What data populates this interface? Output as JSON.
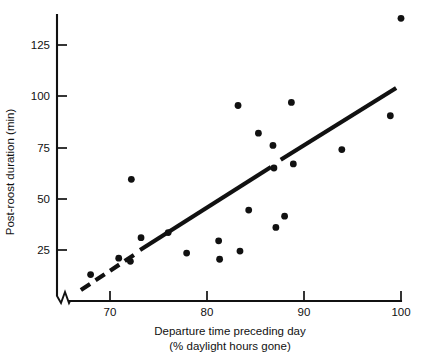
{
  "chart_data": {
    "type": "scatter",
    "title": "",
    "xlabel": "Departure time preceding day",
    "xlabel_line2": "(% daylight hours gone)",
    "ylabel": "Post-roost duration (min)",
    "xlim": [
      66.5,
      100.8
    ],
    "ylim": [
      0,
      142
    ],
    "grid": false,
    "legend": null,
    "axis_break": "x-axis origin break (zigzag)",
    "xticks": [
      70,
      80,
      90,
      100
    ],
    "xtick_labels": [
      "70",
      "80",
      "90",
      "100"
    ],
    "yticks": [
      25,
      50,
      75,
      100,
      125
    ],
    "ytick_labels": [
      "25",
      "50",
      "75",
      "100",
      "125"
    ],
    "points": [
      {
        "x": 68.0,
        "y": 13.0
      },
      {
        "x": 70.9,
        "y": 21.0
      },
      {
        "x": 72.1,
        "y": 19.5
      },
      {
        "x": 72.2,
        "y": 59.5
      },
      {
        "x": 73.2,
        "y": 31.0
      },
      {
        "x": 76.0,
        "y": 33.5
      },
      {
        "x": 77.9,
        "y": 23.5
      },
      {
        "x": 81.2,
        "y": 29.5
      },
      {
        "x": 81.3,
        "y": 20.5
      },
      {
        "x": 83.2,
        "y": 95.5
      },
      {
        "x": 83.4,
        "y": 24.5
      },
      {
        "x": 84.3,
        "y": 44.5
      },
      {
        "x": 85.3,
        "y": 82.0
      },
      {
        "x": 86.8,
        "y": 76.0
      },
      {
        "x": 86.9,
        "y": 65.0
      },
      {
        "x": 87.1,
        "y": 36.0
      },
      {
        "x": 88.0,
        "y": 41.5
      },
      {
        "x": 88.7,
        "y": 97.0
      },
      {
        "x": 88.9,
        "y": 67.0
      },
      {
        "x": 93.9,
        "y": 74.0
      },
      {
        "x": 98.9,
        "y": 90.5
      },
      {
        "x": 100.0,
        "y": 138.0
      }
    ],
    "trend_line": {
      "style": "solid-with-dashed-extension",
      "solid_segments": [
        {
          "x1": 73.1,
          "y1": 25.0,
          "x2": 86.6,
          "y2": 65.5
        },
        {
          "x1": 87.6,
          "y1": 69.0,
          "x2": 99.5,
          "y2": 104.0
        }
      ],
      "dashed_segment": {
        "x1": 67.0,
        "y1": 5.5,
        "x2": 72.6,
        "y2": 23.0
      }
    },
    "colors": {
      "point": "#111111",
      "line": "#111111",
      "axis": "#111111",
      "background": "#ffffff"
    }
  }
}
